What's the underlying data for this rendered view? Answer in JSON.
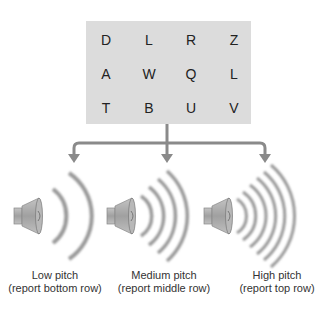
{
  "letter_grid": {
    "rows": [
      [
        "D",
        "L",
        "R",
        "Z"
      ],
      [
        "A",
        "W",
        "Q",
        "L"
      ],
      [
        "T",
        "B",
        "U",
        "V"
      ]
    ]
  },
  "tones": [
    {
      "title": "Low pitch",
      "subtitle": "(report bottom row)",
      "icon": "speaker-icon",
      "wave_count": 2
    },
    {
      "title": "Medium pitch",
      "subtitle": "(report middle row)",
      "icon": "speaker-icon",
      "wave_count": 4
    },
    {
      "title": "High pitch",
      "subtitle": "(report top row)",
      "icon": "speaker-icon",
      "wave_count": 6
    }
  ],
  "colors": {
    "box": "#dcdcdc",
    "arrow": "#8a8a8a",
    "speaker": "#a8a8a8"
  }
}
